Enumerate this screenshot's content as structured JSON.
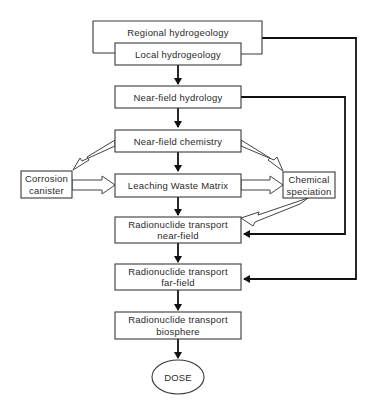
{
  "diagram": {
    "nodes": {
      "regional": "Regional hydrogeology",
      "local": "Local hydrogeology",
      "nf_hydrology": "Near-field hydrology",
      "nf_chemistry": "Near-field chemistry",
      "corrosion_1": "Corrosion",
      "corrosion_2": "canister",
      "leaching": "Leaching Waste Matrix",
      "speciation_1": "Chemical",
      "speciation_2": "speciation",
      "rt_near_1": "Radionuclide transport",
      "rt_near_2": "near-field",
      "rt_far_1": "Radionuclide transport",
      "rt_far_2": "far-field",
      "rt_bio_1": "Radionuclide transport",
      "rt_bio_2": "biosphere",
      "dose": "DOSE"
    },
    "edges": [
      {
        "from": "Local hydrogeology",
        "to": "Near-field hydrology",
        "style": "solid"
      },
      {
        "from": "Near-field hydrology",
        "to": "Near-field chemistry",
        "style": "solid"
      },
      {
        "from": "Near-field chemistry",
        "to": "Leaching Waste Matrix",
        "style": "solid"
      },
      {
        "from": "Leaching Waste Matrix",
        "to": "Radionuclide transport near-field",
        "style": "solid"
      },
      {
        "from": "Radionuclide transport near-field",
        "to": "Radionuclide transport far-field",
        "style": "solid"
      },
      {
        "from": "Radionuclide transport far-field",
        "to": "Radionuclide transport biosphere",
        "style": "solid"
      },
      {
        "from": "Radionuclide transport biosphere",
        "to": "DOSE",
        "style": "solid"
      },
      {
        "from": "Near-field hydrology",
        "to": "Radionuclide transport near-field",
        "style": "solid"
      },
      {
        "from": "Regional hydrogeology",
        "to": "Radionuclide transport far-field",
        "style": "solid"
      },
      {
        "from": "Near-field chemistry",
        "to": "Corrosion canister",
        "style": "hollow"
      },
      {
        "from": "Near-field chemistry",
        "to": "Chemical speciation",
        "style": "hollow"
      },
      {
        "from": "Corrosion canister",
        "to": "Leaching Waste Matrix",
        "style": "hollow"
      },
      {
        "from": "Leaching Waste Matrix",
        "to": "Chemical speciation",
        "style": "hollow"
      },
      {
        "from": "Chemical speciation",
        "to": "Radionuclide transport near-field",
        "style": "hollow"
      }
    ]
  }
}
